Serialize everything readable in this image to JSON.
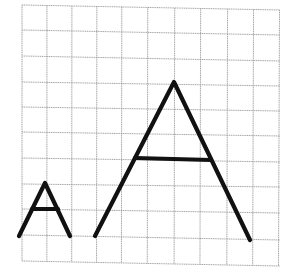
{
  "figure": {
    "grid": {
      "columns": 10,
      "rows": 10,
      "x_lines": [
        22,
        47,
        72,
        97,
        122,
        148,
        175,
        201,
        228,
        254,
        280
      ],
      "y_lines_left": [
        5,
        30,
        56,
        82,
        107,
        132,
        158,
        184,
        209,
        235,
        261
      ],
      "y_lines_right": [
        10,
        35,
        61,
        86,
        111,
        136,
        162,
        187,
        213,
        240,
        266
      ],
      "line_color": "#9a9a9a"
    },
    "shapes": [
      {
        "name": "small-letter-a",
        "apex": [
          45,
          183
        ],
        "left_foot": [
          19,
          236
        ],
        "right_foot": [
          70,
          236
        ],
        "crossbar": [
          [
            32,
            209
          ],
          [
            58,
            209
          ]
        ],
        "color": "#111111"
      },
      {
        "name": "large-letter-a",
        "apex": [
          174,
          82
        ],
        "left_foot": [
          95,
          236
        ],
        "right_foot": [
          250,
          240
        ],
        "crossbar": [
          [
            135,
            158
          ],
          [
            211,
            160
          ]
        ],
        "color": "#111111"
      }
    ]
  }
}
